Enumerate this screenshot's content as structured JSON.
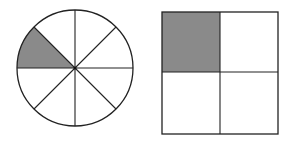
{
  "figure": {
    "colors": {
      "stroke": "#222222",
      "shade": "#8a8a8a",
      "background": "#ffffff"
    },
    "circle": {
      "label": "circle divided into 8 equal parts, 1 shaded",
      "parts": 8,
      "shaded_parts": 1,
      "shaded_fraction": "1/8",
      "cx": 75,
      "cy": 68,
      "r": 58
    },
    "square": {
      "label": "square divided into 4 equal parts, 1 shaded",
      "parts": 4,
      "shaded_parts": 1,
      "shaded_fraction": "1/4",
      "x": 162,
      "y": 12,
      "w": 116,
      "h": 122
    }
  }
}
